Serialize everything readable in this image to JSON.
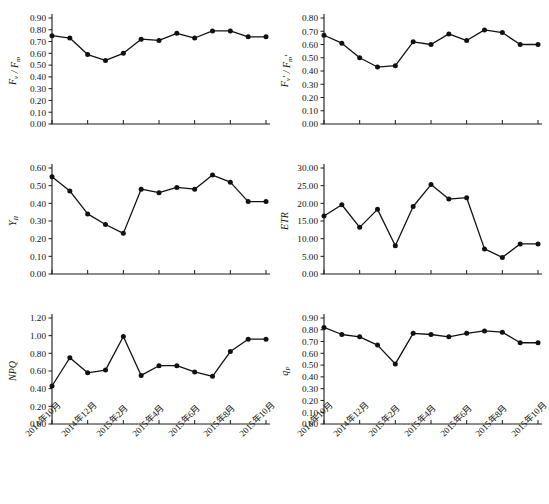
{
  "figure": {
    "title": "",
    "panel_count": 6,
    "x_tick_labels": [
      "2014年10月",
      "2014年12月",
      "2015年2月",
      "2015年4月",
      "2015年6月",
      "2015年8月",
      "2015年10月"
    ],
    "marker_color": "#111111",
    "line_color": "#111111",
    "axis_color": "#1a1a1a"
  },
  "chart_data": [
    {
      "type": "line",
      "panel": "top-left",
      "title": "",
      "xlabel": "",
      "ylabel": "Fv / Fm",
      "ylabel_parts": {
        "main": "F",
        "sub1": "v",
        "sep": "/",
        "main2": "F",
        "sub2": "m"
      },
      "x": [
        1,
        2,
        3,
        4,
        5,
        6,
        7,
        8,
        9,
        10,
        11,
        12,
        13
      ],
      "categories": [
        "2014年10月",
        "2014年11月",
        "2014年12月",
        "2015年1月",
        "2015年2月",
        "2015年3月",
        "2015年4月",
        "2015年5月",
        "2015年6月",
        "2015年7月",
        "2015年8月",
        "2015年9月",
        "2015年10月"
      ],
      "values": [
        0.75,
        0.73,
        0.59,
        0.54,
        0.6,
        0.72,
        0.71,
        0.77,
        0.73,
        0.79,
        0.79,
        0.74,
        0.74
      ],
      "ylim": [
        0.0,
        0.9
      ],
      "ytick_step": 0.1,
      "ytick_labels": [
        "0.00",
        "0.10",
        "0.20",
        "0.30",
        "0.40",
        "0.50",
        "0.60",
        "0.70",
        "0.80",
        "0.90"
      ],
      "grid": false,
      "legend": "none"
    },
    {
      "type": "line",
      "panel": "top-right",
      "title": "",
      "xlabel": "",
      "ylabel": "Fv' / Fm'",
      "ylabel_parts": {
        "main": "F",
        "sub1": "v",
        "prime1": "'",
        "sep": "/",
        "main2": "F",
        "sub2": "m",
        "prime2": "'"
      },
      "x": [
        1,
        2,
        3,
        4,
        5,
        6,
        7,
        8,
        9,
        10,
        11,
        12,
        13
      ],
      "categories": [
        "2014年10月",
        "2014年11月",
        "2014年12月",
        "2015年1月",
        "2015年2月",
        "2015年3月",
        "2015年4月",
        "2015年5月",
        "2015年6月",
        "2015年7月",
        "2015年8月",
        "2015年9月",
        "2015年10月"
      ],
      "values": [
        0.67,
        0.61,
        0.5,
        0.43,
        0.44,
        0.62,
        0.6,
        0.68,
        0.63,
        0.71,
        0.69,
        0.6,
        0.6
      ],
      "ylim": [
        0.0,
        0.8
      ],
      "ytick_step": 0.1,
      "ytick_labels": [
        "0.00",
        "0.10",
        "0.20",
        "0.30",
        "0.40",
        "0.50",
        "0.60",
        "0.70",
        "0.80"
      ],
      "grid": false,
      "legend": "none"
    },
    {
      "type": "line",
      "panel": "middle-left",
      "title": "",
      "xlabel": "",
      "ylabel": "YII",
      "ylabel_parts": {
        "main": "Y",
        "sub1": "II"
      },
      "x": [
        1,
        2,
        3,
        4,
        5,
        6,
        7,
        8,
        9,
        10,
        11,
        12,
        13
      ],
      "categories": [
        "2014年10月",
        "2014年11月",
        "2014年12月",
        "2015年1月",
        "2015年2月",
        "2015年3月",
        "2015年4月",
        "2015年5月",
        "2015年6月",
        "2015年7月",
        "2015年8月",
        "2015年9月",
        "2015年10月"
      ],
      "values": [
        0.55,
        0.47,
        0.34,
        0.28,
        0.23,
        0.48,
        0.46,
        0.49,
        0.48,
        0.56,
        0.52,
        0.41,
        0.41
      ],
      "ylim": [
        0.0,
        0.6
      ],
      "ytick_step": 0.1,
      "ytick_labels": [
        "0.00",
        "0.10",
        "0.20",
        "0.30",
        "0.40",
        "0.50",
        "0.60"
      ],
      "grid": false,
      "legend": "none"
    },
    {
      "type": "line",
      "panel": "middle-right",
      "title": "",
      "xlabel": "",
      "ylabel": "ETR",
      "ylabel_parts": {
        "main": "ETR"
      },
      "x": [
        1,
        2,
        3,
        4,
        5,
        6,
        7,
        8,
        9,
        10,
        11,
        12,
        13
      ],
      "categories": [
        "2014年10月",
        "2014年11月",
        "2014年12月",
        "2015年1月",
        "2015年2月",
        "2015年3月",
        "2015年4月",
        "2015年5月",
        "2015年6月",
        "2015年7月",
        "2015年8月",
        "2015年9月",
        "2015年10月"
      ],
      "values": [
        16.4,
        19.6,
        13.2,
        18.3,
        8.0,
        19.1,
        25.3,
        21.2,
        21.6,
        7.1,
        4.7,
        8.5,
        8.5
      ],
      "ylim": [
        0.0,
        30.0
      ],
      "ytick_step": 5.0,
      "ytick_labels": [
        "0.00",
        "5.00",
        "10.00",
        "15.00",
        "20.00",
        "25.00",
        "30.00"
      ],
      "grid": false,
      "legend": "none"
    },
    {
      "type": "line",
      "panel": "bottom-left",
      "title": "",
      "xlabel": "",
      "ylabel": "NPQ",
      "ylabel_parts": {
        "main": "NPQ"
      },
      "x": [
        1,
        2,
        3,
        4,
        5,
        6,
        7,
        8,
        9,
        10,
        11,
        12,
        13
      ],
      "categories": [
        "2014年10月",
        "2014年11月",
        "2014年12月",
        "2015年1月",
        "2015年2月",
        "2015年3月",
        "2015年4月",
        "2015年5月",
        "2015年6月",
        "2015年7月",
        "2015年8月",
        "2015年9月",
        "2015年10月"
      ],
      "values": [
        0.43,
        0.75,
        0.58,
        0.61,
        0.99,
        0.55,
        0.66,
        0.66,
        0.59,
        0.54,
        0.82,
        0.96,
        0.96
      ],
      "ylim": [
        0.0,
        1.2
      ],
      "ytick_step": 0.2,
      "ytick_labels": [
        "0.00",
        "0.20",
        "0.40",
        "0.60",
        "0.80",
        "1.00",
        "1.20"
      ],
      "grid": false,
      "legend": "none"
    },
    {
      "type": "line",
      "panel": "bottom-right",
      "title": "",
      "xlabel": "",
      "ylabel": "qP",
      "ylabel_parts": {
        "main": "q",
        "sub1": "P"
      },
      "x": [
        1,
        2,
        3,
        4,
        5,
        6,
        7,
        8,
        9,
        10,
        11,
        12,
        13
      ],
      "categories": [
        "2014年10月",
        "2014年11月",
        "2014年12月",
        "2015年1月",
        "2015年2月",
        "2015年3月",
        "2015年4月",
        "2015年5月",
        "2015年6月",
        "2015年7月",
        "2015年8月",
        "2015年9月",
        "2015年10月"
      ],
      "values": [
        0.82,
        0.76,
        0.74,
        0.67,
        0.51,
        0.77,
        0.76,
        0.74,
        0.77,
        0.79,
        0.78,
        0.69,
        0.69
      ],
      "ylim": [
        0.0,
        0.9
      ],
      "ytick_step": 0.1,
      "ytick_labels": [
        "0.00",
        "0.10",
        "0.20",
        "0.30",
        "0.40",
        "0.50",
        "0.60",
        "0.70",
        "0.80",
        "0.90"
      ],
      "grid": false,
      "legend": "none"
    }
  ]
}
